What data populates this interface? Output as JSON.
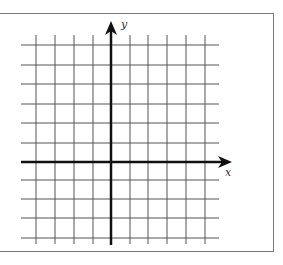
{
  "diagram": {
    "type": "coordinate-grid",
    "x_axis_label": "x",
    "y_axis_label": "y",
    "grid": {
      "vertical_lines_x": [
        36,
        55,
        74,
        93,
        130,
        148,
        167,
        186,
        205
      ],
      "horizontal_lines_y": [
        45,
        65,
        84,
        104,
        123,
        143,
        180,
        199,
        218,
        238
      ],
      "line_color": "#555555",
      "x_extent": [
        21,
        219
      ],
      "y_extent": [
        35,
        244
      ]
    },
    "axes": {
      "origin": [
        111,
        162
      ],
      "x_axis_start": 21,
      "x_axis_arrow_tip": 232,
      "y_axis_end": 245,
      "y_axis_arrow_tip": 21,
      "color": "#111111"
    },
    "frame": {
      "border_color": "#777777"
    }
  }
}
